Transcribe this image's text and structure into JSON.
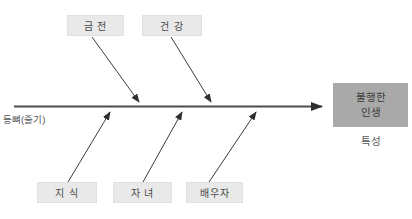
{
  "diagram": {
    "spine_label": "등뼈(줄기)",
    "top_causes": [
      {
        "label": "금 전"
      },
      {
        "label": "건 강"
      }
    ],
    "bottom_causes": [
      {
        "label": "지 식"
      },
      {
        "label": "자 녀"
      },
      {
        "label": "배우자"
      }
    ],
    "effect": {
      "label_line1": "불행한",
      "label_line2": "인생",
      "caption": "특성"
    },
    "colors": {
      "background": "#ffffff",
      "cause_box_bg": "#e9e9e9",
      "effect_box_bg": "#a9a9a9",
      "line": "#3c3c3c",
      "text": "#4a4a4a"
    }
  }
}
